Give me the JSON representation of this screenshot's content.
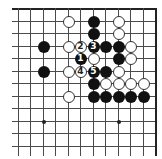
{
  "board": {
    "grid": {
      "columns": 12,
      "rows": 12,
      "origin_x": 18,
      "origin_y": 8,
      "spacing_x": 12.45,
      "spacing_y": 12.5,
      "top_edge": true,
      "right_edge": true
    },
    "colors": {
      "line": "#4a4a4a",
      "black_stone": "#111111",
      "white_stone": "#ffffff"
    },
    "star_points": [
      {
        "col": 2,
        "row": 9
      },
      {
        "col": 8,
        "row": 9
      }
    ],
    "stones": [
      {
        "col": 4,
        "row": 1,
        "color": "white",
        "label": ""
      },
      {
        "col": 6,
        "row": 1,
        "color": "black",
        "label": ""
      },
      {
        "col": 8,
        "row": 1,
        "color": "white",
        "label": ""
      },
      {
        "col": 6,
        "row": 2,
        "color": "black",
        "label": ""
      },
      {
        "col": 8,
        "row": 2,
        "color": "white",
        "label": ""
      },
      {
        "col": 2,
        "row": 3,
        "color": "black",
        "label": ""
      },
      {
        "col": 4,
        "row": 3,
        "color": "white",
        "label": ""
      },
      {
        "col": 5,
        "row": 3,
        "color": "white",
        "label": "2"
      },
      {
        "col": 6,
        "row": 3,
        "color": "black",
        "label": "3"
      },
      {
        "col": 7,
        "row": 3,
        "color": "black",
        "label": ""
      },
      {
        "col": 8,
        "row": 3,
        "color": "black",
        "label": ""
      },
      {
        "col": 9,
        "row": 3,
        "color": "white",
        "label": ""
      },
      {
        "col": 5,
        "row": 4,
        "color": "black",
        "label": "1"
      },
      {
        "col": 6,
        "row": 4,
        "color": "white",
        "label": ""
      },
      {
        "col": 8,
        "row": 4,
        "color": "black",
        "label": ""
      },
      {
        "col": 9,
        "row": 4,
        "color": "white",
        "label": ""
      },
      {
        "col": 2,
        "row": 5,
        "color": "black",
        "label": ""
      },
      {
        "col": 4,
        "row": 5,
        "color": "white",
        "label": ""
      },
      {
        "col": 5,
        "row": 5,
        "color": "white",
        "label": "4"
      },
      {
        "col": 6,
        "row": 5,
        "color": "black",
        "label": "5"
      },
      {
        "col": 7,
        "row": 5,
        "color": "black",
        "label": ""
      },
      {
        "col": 8,
        "row": 5,
        "color": "white",
        "label": ""
      },
      {
        "col": 6,
        "row": 6,
        "color": "black",
        "label": ""
      },
      {
        "col": 7,
        "row": 6,
        "color": "white",
        "label": ""
      },
      {
        "col": 8,
        "row": 6,
        "color": "white",
        "label": ""
      },
      {
        "col": 9,
        "row": 6,
        "color": "white",
        "label": ""
      },
      {
        "col": 10,
        "row": 6,
        "color": "white",
        "label": ""
      },
      {
        "col": 4,
        "row": 7,
        "color": "white",
        "label": ""
      },
      {
        "col": 6,
        "row": 7,
        "color": "black",
        "label": ""
      },
      {
        "col": 7,
        "row": 7,
        "color": "black",
        "label": ""
      },
      {
        "col": 8,
        "row": 7,
        "color": "black",
        "label": ""
      },
      {
        "col": 9,
        "row": 7,
        "color": "black",
        "label": ""
      },
      {
        "col": 10,
        "row": 7,
        "color": "black",
        "label": ""
      }
    ]
  }
}
